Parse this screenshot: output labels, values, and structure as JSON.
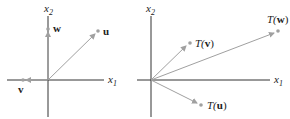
{
  "left_panel": {
    "axis_x_label": "x",
    "axis_x_sub": "1",
    "axis_y_label": "x",
    "axis_y_sub": "2",
    "vectors": [
      {
        "name": "u",
        "label": "u"
      },
      {
        "name": "w",
        "label": "w"
      },
      {
        "name": "v",
        "label": "v"
      }
    ]
  },
  "right_panel": {
    "axis_x_label": "x",
    "axis_x_sub": "1",
    "axis_y_label": "x",
    "axis_y_sub": "2",
    "vectors": [
      {
        "name": "T(v)",
        "fn": "T(",
        "arg": "v",
        "close": ")"
      },
      {
        "name": "T(w)",
        "fn": "T(",
        "arg": "w",
        "close": ")"
      },
      {
        "name": "T(u)",
        "fn": "T(",
        "arg": "u",
        "close": ")"
      }
    ]
  },
  "colors": {
    "axis": "#333333",
    "vector": "#a0a0a0",
    "dot": "#a0a0a0"
  }
}
